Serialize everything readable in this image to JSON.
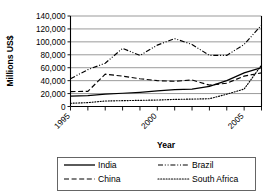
{
  "chart_data": {
    "type": "line",
    "title": "",
    "xlabel": "Year",
    "ylabel": "Millions US$",
    "x": [
      1995,
      1996,
      1997,
      1998,
      1999,
      2000,
      2001,
      2002,
      2003,
      2004,
      2005,
      2006
    ],
    "xlim": [
      1995,
      2006
    ],
    "ylim": [
      0,
      140000
    ],
    "ytick_values": [
      0,
      20000,
      40000,
      60000,
      80000,
      100000,
      120000,
      140000
    ],
    "ytick_labels": [
      "0",
      "20,000",
      "40,000",
      "60,000",
      "80,000",
      "100,000",
      "120,000",
      "140,000"
    ],
    "xtick_values": [
      1995,
      1996,
      1997,
      1998,
      1999,
      2000,
      2001,
      2002,
      2003,
      2004,
      2005,
      2006
    ],
    "xtick_labels": [
      "1995",
      "",
      "",
      "",
      "",
      "2000",
      "",
      "",
      "",
      "",
      "2005",
      ""
    ],
    "grid": "horizontal",
    "legend_position": "bottom",
    "series": [
      {
        "name": "India",
        "style": "solid",
        "values": [
          16000,
          17000,
          19000,
          20500,
          22000,
          24000,
          26000,
          27000,
          31000,
          40000,
          52000,
          60000
        ]
      },
      {
        "name": "China",
        "style": "dashed",
        "values": [
          23000,
          23500,
          50000,
          47000,
          43000,
          40000,
          39000,
          41000,
          33000,
          36000,
          47000,
          52000
        ]
      },
      {
        "name": "Brazil",
        "style": "dash-dot-dot",
        "values": [
          43000,
          57000,
          67000,
          90000,
          79000,
          95000,
          105000,
          96000,
          79000,
          79000,
          96000,
          126000
        ]
      },
      {
        "name": "South Africa",
        "style": "dotted",
        "values": [
          5000,
          6000,
          8500,
          9000,
          9500,
          10000,
          11000,
          11500,
          12000,
          19000,
          27000,
          64000
        ]
      }
    ]
  },
  "legend": {
    "entries": [
      {
        "label": "India",
        "style": "solid"
      },
      {
        "label": "Brazil",
        "style": "dash-dot-dot"
      },
      {
        "label": "China",
        "style": "dashed"
      },
      {
        "label": "South Africa",
        "style": "dotted"
      }
    ]
  },
  "axes": {
    "x_title": "Year",
    "y_title": "Millions US$"
  },
  "colors": {
    "line": "#000000",
    "grid": "#6e6e6e",
    "background": "#ffffff",
    "legend_border": "#555555"
  }
}
